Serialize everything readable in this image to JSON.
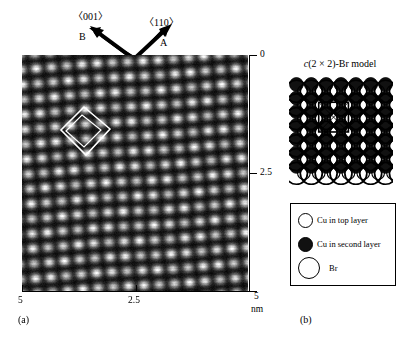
{
  "figure": {
    "panel_a": {
      "label": "(a)",
      "orientation": {
        "direction_left_label": "〈001〉",
        "direction_left_arrow_name": "B",
        "direction_right_label": "〈110〉",
        "direction_right_arrow_name": "A"
      },
      "axes": {
        "unit": "nm",
        "x_ticks": [
          "5",
          "2.5",
          "0"
        ],
        "y_ticks": [
          "5",
          "2.5",
          "0"
        ],
        "x_range_nm": [
          5,
          0
        ],
        "y_range_nm": [
          0,
          5
        ]
      },
      "image_description": "STM topograph of a square lattice of bright protrusions with a rhombic unit cell outlined in the upper-left region"
    },
    "panel_b": {
      "label": "(b)",
      "title_prefix_italic": "c",
      "title_rest": "(2 × 2)-Br model",
      "title_full": "c(2 × 2)-Br model",
      "legend": [
        {
          "symbol": "open-small-circle",
          "text": "Cu in top layer"
        },
        {
          "symbol": "filled-small-circle",
          "text": "Cu in second layer"
        },
        {
          "symbol": "open-large-circle",
          "text": "Br"
        }
      ]
    }
  },
  "chart_data": {
    "type": "heatmap",
    "title": "",
    "xlabel": "nm",
    "ylabel": "nm",
    "xlim": [
      5,
      0
    ],
    "ylim": [
      0,
      5
    ],
    "xticks": [
      5,
      2.5,
      0
    ],
    "yticks": [
      0,
      2.5,
      5
    ],
    "grid": false,
    "legend_position": "none",
    "lattice": {
      "spots_across": 15,
      "spots_down": 16,
      "spacing_nm": 0.36,
      "rotation_deg": -4,
      "spot_color": "#ffffff",
      "background_color": "#050505"
    },
    "model": {
      "type": "structure-diagram",
      "name": "c(2 × 2)-Br model",
      "columns": 7,
      "rows": 6,
      "species": [
        {
          "name": "Cu in top layer",
          "marker": "open small circle",
          "radius_px": 7
        },
        {
          "name": "Cu in second layer",
          "marker": "filled small circle",
          "radius_px": 7
        },
        {
          "name": "Br",
          "marker": "open large circle",
          "radius_px": 11
        }
      ]
    }
  }
}
